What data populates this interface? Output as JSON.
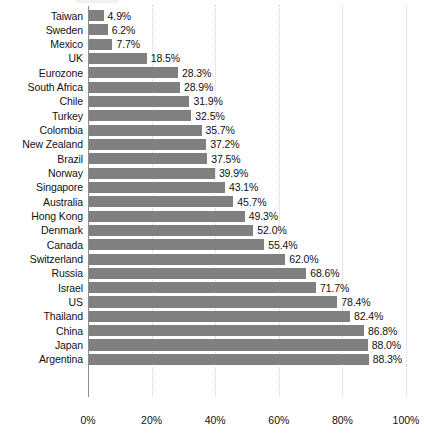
{
  "chart_data": {
    "type": "bar",
    "orientation": "horizontal",
    "title": "",
    "subtitle": "",
    "xlabel": "",
    "ylabel": "",
    "xlim": [
      0,
      100
    ],
    "grid": true,
    "legend": false,
    "value_suffix": "%",
    "bar_color": "#808080",
    "gridline_color": "#d5d5d5",
    "axis_color": "#8c8c8c",
    "xticks": [
      0,
      20,
      40,
      60,
      80,
      100
    ],
    "xtick_labels": [
      "0%",
      "20%",
      "40%",
      "60%",
      "80%",
      "100%"
    ],
    "categories": [
      "Taiwan",
      "Sweden",
      "Mexico",
      "UK",
      "Eurozone",
      "South Africa",
      "Chile",
      "Turkey",
      "Colombia",
      "New Zealand",
      "Brazil",
      "Norway",
      "Singapore",
      "Australia",
      "Hong Kong",
      "Denmark",
      "Canada",
      "Switzerland",
      "Russia",
      "Israel",
      "US",
      "Thailand",
      "China",
      "Japan",
      "Argentina"
    ],
    "values": [
      4.9,
      6.2,
      7.7,
      18.5,
      28.3,
      28.9,
      31.9,
      32.5,
      35.7,
      37.2,
      37.5,
      39.9,
      43.1,
      45.7,
      49.3,
      52.0,
      55.4,
      62.0,
      68.6,
      71.7,
      78.4,
      82.4,
      86.8,
      88.0,
      88.3
    ],
    "value_labels": [
      "4.9%",
      "6.2%",
      "7.7%",
      "18.5%",
      "28.3%",
      "28.9%",
      "31.9%",
      "32.5%",
      "35.7%",
      "37.2%",
      "37.5%",
      "39.9%",
      "43.1%",
      "45.7%",
      "49.3%",
      "52.0%",
      "55.4%",
      "62.0%",
      "68.6%",
      "71.7%",
      "78.4%",
      "82.4%",
      "86.8%",
      "88.0%",
      "88.3%"
    ]
  }
}
